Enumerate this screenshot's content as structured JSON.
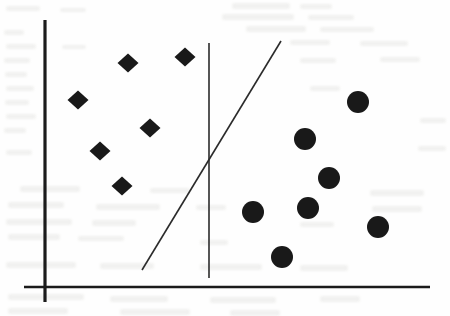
{
  "figure": {
    "title": "",
    "background_color": "#fefefe",
    "ink_color": "#191919",
    "width": 450,
    "height": 316
  },
  "chart_data": {
    "type": "scatter",
    "title": "",
    "xlabel": "",
    "ylabel": "",
    "xlim": [
      0,
      450
    ],
    "ylim": [
      0,
      316
    ],
    "grid": false,
    "legend": "none",
    "axes": {
      "y_axis": {
        "name": "y-axis",
        "orientation": "vertical",
        "x": 45,
        "y_top": 20,
        "y_bottom": 302,
        "stroke_width": 3.2,
        "color": "#1b1b1b"
      },
      "x_axis": {
        "name": "x-axis",
        "orientation": "horizontal",
        "y": 287,
        "x_left": 24,
        "x_right": 430,
        "stroke_width": 2.6,
        "color": "#1b1b1b"
      }
    },
    "series": [
      {
        "name": "Class A",
        "marker": "diamond",
        "color": "#191919",
        "count": 6,
        "marker_width": 21,
        "marker_height": 19,
        "points": [
          {
            "x": 128,
            "y": 63
          },
          {
            "x": 185,
            "y": 57
          },
          {
            "x": 78,
            "y": 100
          },
          {
            "x": 150,
            "y": 128
          },
          {
            "x": 100,
            "y": 151
          },
          {
            "x": 122,
            "y": 186
          }
        ]
      },
      {
        "name": "Class B",
        "marker": "circle",
        "color": "#191919",
        "count": 7,
        "marker_radius": 11,
        "points": [
          {
            "x": 358,
            "y": 102
          },
          {
            "x": 305,
            "y": 139
          },
          {
            "x": 329,
            "y": 178
          },
          {
            "x": 308,
            "y": 208
          },
          {
            "x": 253,
            "y": 212
          },
          {
            "x": 378,
            "y": 227
          },
          {
            "x": 282,
            "y": 257
          }
        ]
      }
    ],
    "annotations": [
      {
        "name": "decision-boundary-diagonal",
        "type": "line",
        "x1": 142,
        "y1": 270,
        "x2": 281,
        "y2": 41,
        "stroke_width": 1.6,
        "color": "#2b2b2b"
      },
      {
        "name": "decision-boundary-vertical",
        "type": "line",
        "x1": 209,
        "y1": 278,
        "x2": 209,
        "y2": 43,
        "stroke_width": 1.6,
        "color": "#2b2b2b"
      }
    ]
  },
  "background_smudges": [
    {
      "x": 6,
      "y": 6,
      "w": 34,
      "h": 5
    },
    {
      "x": 60,
      "y": 8,
      "w": 26,
      "h": 4
    },
    {
      "x": 232,
      "y": 3,
      "w": 58,
      "h": 6
    },
    {
      "x": 300,
      "y": 4,
      "w": 32,
      "h": 5
    },
    {
      "x": 222,
      "y": 14,
      "w": 72,
      "h": 6
    },
    {
      "x": 308,
      "y": 15,
      "w": 46,
      "h": 5
    },
    {
      "x": 246,
      "y": 26,
      "w": 60,
      "h": 6
    },
    {
      "x": 320,
      "y": 27,
      "w": 54,
      "h": 5
    },
    {
      "x": 4,
      "y": 30,
      "w": 20,
      "h": 5
    },
    {
      "x": 6,
      "y": 44,
      "w": 30,
      "h": 5
    },
    {
      "x": 62,
      "y": 45,
      "w": 24,
      "h": 4
    },
    {
      "x": 290,
      "y": 40,
      "w": 40,
      "h": 5
    },
    {
      "x": 360,
      "y": 41,
      "w": 48,
      "h": 5
    },
    {
      "x": 4,
      "y": 58,
      "w": 26,
      "h": 5
    },
    {
      "x": 300,
      "y": 58,
      "w": 36,
      "h": 5
    },
    {
      "x": 380,
      "y": 57,
      "w": 40,
      "h": 5
    },
    {
      "x": 5,
      "y": 72,
      "w": 22,
      "h": 5
    },
    {
      "x": 6,
      "y": 86,
      "w": 28,
      "h": 5
    },
    {
      "x": 310,
      "y": 86,
      "w": 30,
      "h": 5
    },
    {
      "x": 5,
      "y": 100,
      "w": 24,
      "h": 5
    },
    {
      "x": 6,
      "y": 114,
      "w": 30,
      "h": 5
    },
    {
      "x": 420,
      "y": 118,
      "w": 26,
      "h": 5
    },
    {
      "x": 4,
      "y": 128,
      "w": 22,
      "h": 5
    },
    {
      "x": 418,
      "y": 146,
      "w": 28,
      "h": 5
    },
    {
      "x": 6,
      "y": 150,
      "w": 26,
      "h": 5
    },
    {
      "x": 20,
      "y": 186,
      "w": 60,
      "h": 6
    },
    {
      "x": 150,
      "y": 188,
      "w": 40,
      "h": 5
    },
    {
      "x": 370,
      "y": 190,
      "w": 54,
      "h": 6
    },
    {
      "x": 8,
      "y": 202,
      "w": 56,
      "h": 6
    },
    {
      "x": 96,
      "y": 204,
      "w": 64,
      "h": 6
    },
    {
      "x": 196,
      "y": 205,
      "w": 30,
      "h": 5
    },
    {
      "x": 372,
      "y": 206,
      "w": 50,
      "h": 6
    },
    {
      "x": 6,
      "y": 219,
      "w": 66,
      "h": 6
    },
    {
      "x": 92,
      "y": 220,
      "w": 44,
      "h": 6
    },
    {
      "x": 300,
      "y": 222,
      "w": 34,
      "h": 5
    },
    {
      "x": 8,
      "y": 234,
      "w": 52,
      "h": 6
    },
    {
      "x": 78,
      "y": 236,
      "w": 46,
      "h": 5
    },
    {
      "x": 200,
      "y": 240,
      "w": 28,
      "h": 5
    },
    {
      "x": 6,
      "y": 262,
      "w": 70,
      "h": 6
    },
    {
      "x": 100,
      "y": 263,
      "w": 54,
      "h": 6
    },
    {
      "x": 200,
      "y": 264,
      "w": 62,
      "h": 6
    },
    {
      "x": 300,
      "y": 265,
      "w": 48,
      "h": 6
    },
    {
      "x": 8,
      "y": 294,
      "w": 76,
      "h": 6
    },
    {
      "x": 110,
      "y": 296,
      "w": 58,
      "h": 6
    },
    {
      "x": 210,
      "y": 297,
      "w": 66,
      "h": 6
    },
    {
      "x": 320,
      "y": 296,
      "w": 40,
      "h": 6
    },
    {
      "x": 8,
      "y": 308,
      "w": 60,
      "h": 6
    },
    {
      "x": 120,
      "y": 309,
      "w": 70,
      "h": 6
    },
    {
      "x": 230,
      "y": 310,
      "w": 50,
      "h": 6
    }
  ]
}
